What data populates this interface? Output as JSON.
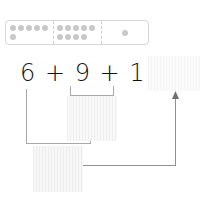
{
  "ten_frame": {
    "cells": [
      {
        "label": "six",
        "count": 6
      },
      {
        "label": "nine",
        "count": 9
      },
      {
        "label": "one",
        "count": 1
      }
    ],
    "dot_color": "#c9c9c9",
    "border_color": "#d6d6d6"
  },
  "equation": {
    "text": "6 + 9 + 1 =",
    "terms": [
      "6",
      "9",
      "1"
    ],
    "operators": [
      "+",
      "+",
      "="
    ]
  },
  "boxes": {
    "answer": "",
    "nine_plus_one": "",
    "six_plus_ten": ""
  },
  "connector_color": "#a8a8a8"
}
